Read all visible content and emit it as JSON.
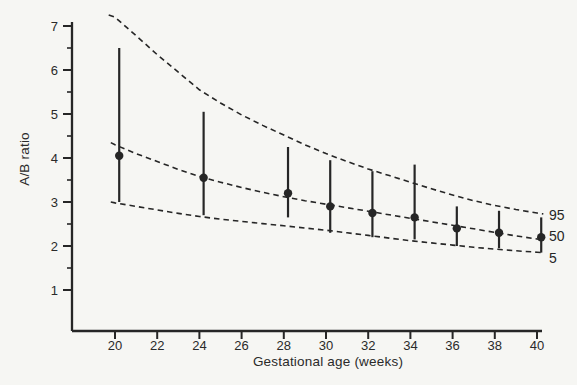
{
  "figure": {
    "background": "#f6f6f3",
    "ink_color": "#262626",
    "text_color": "#2a2a2a"
  },
  "chart_data": {
    "type": "scatter",
    "subtype": "means-with-error-bars-and-percentile-curves",
    "title": "",
    "xlabel": "Gestational age (weeks)",
    "ylabel": "A/B ratio",
    "xlim": [
      18,
      40.3
    ],
    "ylim": [
      0,
      7.1
    ],
    "x_ticks": [
      20,
      22,
      24,
      26,
      28,
      30,
      32,
      34,
      36,
      38,
      40
    ],
    "y_ticks": [
      1,
      2,
      3,
      4,
      5,
      6,
      7
    ],
    "y_minor_ticks": [
      1.5,
      2.5,
      3.5,
      4.5,
      5.5,
      6.5
    ],
    "grid": false,
    "legend_position": "right-edge-curve-labels",
    "point_x_offset_weeks": 0.2,
    "points": [
      {
        "week": 20,
        "mean": 4.05,
        "lo": 3.0,
        "hi": 6.5
      },
      {
        "week": 24,
        "mean": 3.55,
        "lo": 2.7,
        "hi": 5.05
      },
      {
        "week": 28,
        "mean": 3.2,
        "lo": 2.65,
        "hi": 4.25
      },
      {
        "week": 30,
        "mean": 2.9,
        "lo": 2.3,
        "hi": 3.95
      },
      {
        "week": 32,
        "mean": 2.75,
        "lo": 2.2,
        "hi": 3.7
      },
      {
        "week": 34,
        "mean": 2.65,
        "lo": 2.15,
        "hi": 3.85
      },
      {
        "week": 36,
        "mean": 2.4,
        "lo": 2.0,
        "hi": 2.9
      },
      {
        "week": 38,
        "mean": 2.3,
        "lo": 1.95,
        "hi": 2.8
      },
      {
        "week": 40,
        "mean": 2.2,
        "lo": 1.85,
        "hi": 2.65
      }
    ],
    "curves": [
      {
        "label": "95",
        "percentile": 95,
        "points": [
          [
            19.7,
            7.25
          ],
          [
            20,
            7.2
          ],
          [
            21,
            6.78
          ],
          [
            22,
            6.35
          ],
          [
            23,
            5.95
          ],
          [
            24,
            5.55
          ],
          [
            25,
            5.25
          ],
          [
            26,
            4.98
          ],
          [
            27,
            4.74
          ],
          [
            28,
            4.52
          ],
          [
            29,
            4.3
          ],
          [
            30,
            4.1
          ],
          [
            31,
            3.92
          ],
          [
            32,
            3.75
          ],
          [
            33,
            3.6
          ],
          [
            34,
            3.45
          ],
          [
            35,
            3.3
          ],
          [
            36,
            3.16
          ],
          [
            37,
            3.03
          ],
          [
            38,
            2.92
          ],
          [
            39,
            2.83
          ],
          [
            40,
            2.75
          ],
          [
            40.3,
            2.73
          ]
        ]
      },
      {
        "label": "50",
        "percentile": 50,
        "points": [
          [
            19.8,
            4.35
          ],
          [
            20,
            4.3
          ],
          [
            21,
            4.1
          ],
          [
            22,
            3.92
          ],
          [
            23,
            3.74
          ],
          [
            24,
            3.58
          ],
          [
            25,
            3.45
          ],
          [
            26,
            3.33
          ],
          [
            27,
            3.22
          ],
          [
            28,
            3.12
          ],
          [
            29,
            3.03
          ],
          [
            30,
            2.95
          ],
          [
            31,
            2.87
          ],
          [
            32,
            2.79
          ],
          [
            33,
            2.71
          ],
          [
            34,
            2.63
          ],
          [
            35,
            2.55
          ],
          [
            36,
            2.47
          ],
          [
            37,
            2.39
          ],
          [
            38,
            2.31
          ],
          [
            39,
            2.23
          ],
          [
            40,
            2.16
          ],
          [
            40.3,
            2.14
          ]
        ]
      },
      {
        "label": "5",
        "percentile": 5,
        "points": [
          [
            19.8,
            3.0
          ],
          [
            20,
            2.98
          ],
          [
            21,
            2.9
          ],
          [
            22,
            2.82
          ],
          [
            23,
            2.74
          ],
          [
            24,
            2.67
          ],
          [
            25,
            2.61
          ],
          [
            26,
            2.56
          ],
          [
            27,
            2.51
          ],
          [
            28,
            2.46
          ],
          [
            29,
            2.41
          ],
          [
            30,
            2.36
          ],
          [
            31,
            2.3
          ],
          [
            32,
            2.24
          ],
          [
            33,
            2.18
          ],
          [
            34,
            2.12
          ],
          [
            35,
            2.07
          ],
          [
            36,
            2.02
          ],
          [
            37,
            1.97
          ],
          [
            38,
            1.93
          ],
          [
            39,
            1.89
          ],
          [
            40,
            1.86
          ],
          [
            40.3,
            1.85
          ]
        ]
      }
    ]
  }
}
